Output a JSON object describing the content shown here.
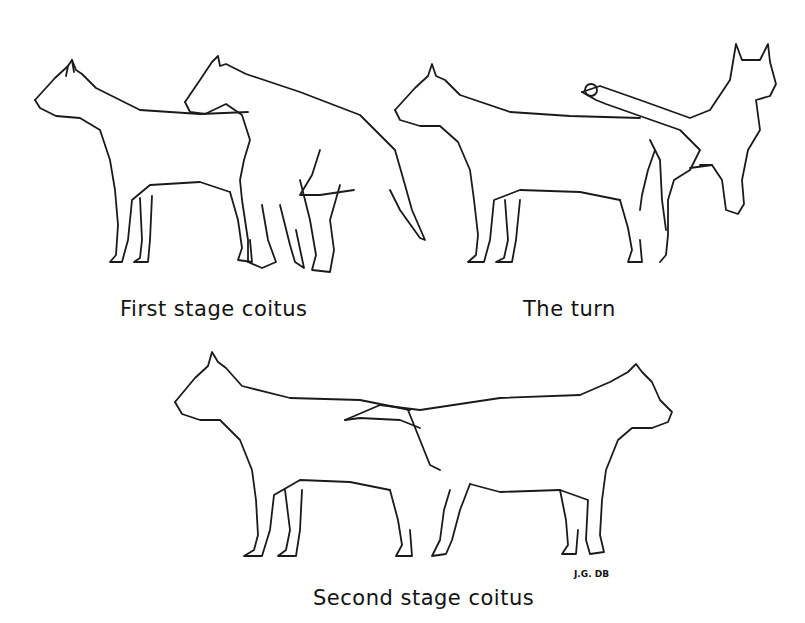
{
  "figure": {
    "panels": [
      {
        "id": "first-stage",
        "caption": "First stage coitus"
      },
      {
        "id": "the-turn",
        "caption": "The turn"
      },
      {
        "id": "second-stage",
        "caption": "Second stage coitus"
      }
    ],
    "signature": "J.G. DB"
  }
}
